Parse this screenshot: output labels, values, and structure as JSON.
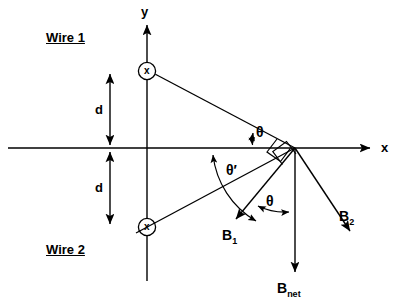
{
  "figure": {
    "width": 404,
    "height": 307,
    "background": "#ffffff",
    "stroke": "#000000"
  },
  "axes": {
    "x_label": "x",
    "y_label": "y",
    "origin": {
      "x": 147,
      "y": 148
    },
    "x_axis": {
      "x1": 8,
      "y1": 148,
      "x2": 372,
      "y2": 148
    },
    "y_axis": {
      "x1": 147,
      "y1": 280,
      "x2": 147,
      "y2": 22
    },
    "x_label_pos": {
      "x": 381,
      "y": 141
    },
    "y_label_pos": {
      "x": 141,
      "y": 6
    }
  },
  "wires": [
    {
      "name": "Wire 1",
      "label": "Wire 1",
      "label_pos": {
        "x": 46,
        "y": 31
      },
      "symbol": "x",
      "current_direction": "into-page",
      "center": {
        "x": 147,
        "y": 71
      },
      "radius": 9
    },
    {
      "name": "Wire 2",
      "label": "Wire 2",
      "label_pos": {
        "x": 46,
        "y": 243
      },
      "symbol": "x",
      "current_direction": "into-page",
      "center": {
        "x": 147,
        "y": 227
      },
      "radius": 9
    }
  ],
  "distances": [
    {
      "label": "d",
      "label_pos": {
        "x": 96,
        "y": 103
      },
      "arrow": {
        "x": 110,
        "y1": 71,
        "y2": 148
      }
    },
    {
      "label": "d",
      "label_pos": {
        "x": 96,
        "y": 181
      },
      "arrow": {
        "x": 110,
        "y1": 148,
        "y2": 227
      }
    }
  ],
  "field_point": {
    "x": 295,
    "y": 148,
    "label": "P"
  },
  "rays": [
    {
      "name": "wire1-to-point",
      "x1": 156,
      "y1": 76,
      "x2": 295,
      "y2": 148
    },
    {
      "name": "wire2-to-point",
      "x1": 156,
      "y1": 222,
      "x2": 295,
      "y2": 148
    },
    {
      "name": "wire2-ray-extended",
      "x1": 137,
      "y1": 232,
      "x2": 295,
      "y2": 148
    }
  ],
  "vectors": [
    {
      "name": "B1",
      "label": "B",
      "sub": "1",
      "label_pos": {
        "x": 224,
        "y": 233
      },
      "x1": 295,
      "y1": 148,
      "x2": 233,
      "y2": 222
    },
    {
      "name": "B2",
      "label": "B",
      "sub": "2",
      "label_pos": {
        "x": 340,
        "y": 214
      },
      "x1": 295,
      "y1": 148,
      "x2": 353,
      "y2": 235
    },
    {
      "name": "Bnet",
      "label": "B",
      "sub": "net",
      "label_pos": {
        "x": 280,
        "y": 285
      },
      "x1": 295,
      "y1": 148,
      "x2": 295,
      "y2": 277
    }
  ],
  "angles": [
    {
      "name": "theta-upper",
      "label": "θ",
      "label_pos": {
        "x": 256,
        "y": 126
      }
    },
    {
      "name": "theta-prime",
      "label": "θ′",
      "label_pos": {
        "x": 229,
        "y": 166
      }
    },
    {
      "name": "theta-lower",
      "label": "θ",
      "label_pos": {
        "x": 268,
        "y": 196
      }
    }
  ],
  "right_angle_markers": [
    {
      "name": "right-angle-b1",
      "vertex": {
        "x": 295,
        "y": 148
      }
    },
    {
      "name": "right-angle-b2",
      "vertex": {
        "x": 295,
        "y": 148
      }
    }
  ]
}
